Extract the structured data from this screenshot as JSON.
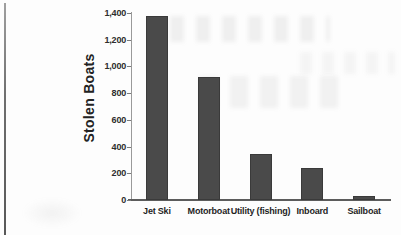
{
  "chart_data": {
    "type": "bar",
    "title": "",
    "xlabel": "",
    "ylabel": "Stolen Boats",
    "categories": [
      "Jet Ski",
      "Motorboat",
      "Utility (fishing)",
      "Inboard",
      "Sailboat"
    ],
    "values": [
      1380,
      920,
      345,
      240,
      30
    ],
    "ylim": [
      0,
      1400
    ],
    "ytick_step": 200,
    "ytick_labels": [
      "0",
      "200",
      "400",
      "600",
      "800",
      "1,000",
      "1,200",
      "1,400"
    ],
    "grid": false,
    "legend": "none",
    "bar_color": "#4a4a4a",
    "bar_edge_color": "#3a3a3a",
    "axis_color": "#5c5c5c",
    "tick_text_color": "#2d2d2d"
  }
}
